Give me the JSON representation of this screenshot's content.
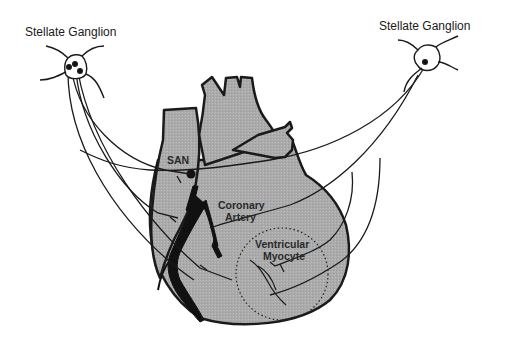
{
  "figure": {
    "labels": {
      "left_ganglion": "Stellate Ganglion",
      "right_ganglion": "Stellate Ganglion",
      "san": "SAN",
      "coronary_line1": "Coronary",
      "coronary_line2": "Artery",
      "myocyte_line1": "Ventricular",
      "myocyte_line2": "Myocyte"
    },
    "colors": {
      "heart_fill": "#a9a9a9",
      "outline": "#1a1a1a",
      "artery": "#111111",
      "background": "#ffffff"
    }
  }
}
